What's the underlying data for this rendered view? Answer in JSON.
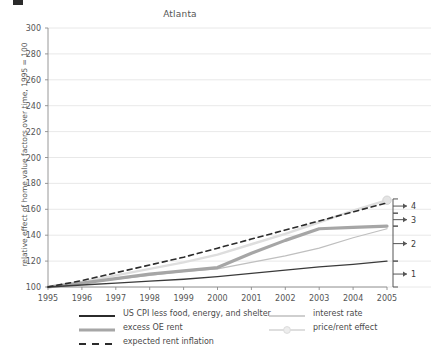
{
  "chart_data": {
    "type": "line",
    "title": "Atlanta",
    "xlabel": "",
    "ylabel": "relative effect of home value factors over time, 1995 = 100",
    "x": [
      1995,
      1996,
      1997,
      1998,
      1999,
      2000,
      2001,
      2002,
      2003,
      2004,
      2005
    ],
    "xlim": [
      1995,
      2005
    ],
    "ylim": [
      100,
      300
    ],
    "yticks": [
      100,
      120,
      140,
      160,
      180,
      200,
      220,
      240,
      260,
      280,
      300
    ],
    "xticks": [
      "1995",
      "1996",
      "1997",
      "1998",
      "1999",
      "2000",
      "2001",
      "2002",
      "2003",
      "2004",
      "2005"
    ],
    "grid": true,
    "legend_position": "below",
    "series": [
      {
        "name": "US CPI less food, energy, and shelter",
        "style": "solid",
        "color": "#3a3a3a",
        "width": 1.4,
        "values": [
          100,
          101.5,
          103,
          104.5,
          106,
          108,
          110.5,
          113,
          115.5,
          117.5,
          120
        ]
      },
      {
        "name": "excess OE rent",
        "style": "solid",
        "color": "#a6a6a6",
        "width": 3.2,
        "values": [
          100,
          103,
          106.5,
          110,
          112.5,
          115,
          126,
          136,
          145,
          146,
          147
        ]
      },
      {
        "name": "expected rent inflation",
        "style": "dashed",
        "color": "#2b2b2b",
        "width": 1.6,
        "values": [
          100,
          105,
          111,
          117,
          123,
          130,
          137,
          144,
          151,
          158,
          165
        ]
      },
      {
        "name": "interest rate",
        "style": "solid",
        "color": "#bfbfbf",
        "width": 1.2,
        "values": [
          100,
          103,
          106,
          109,
          112,
          114,
          119,
          124,
          130,
          138,
          145
        ]
      },
      {
        "name": "price/rent effect",
        "style": "solid-marker",
        "color": "#dedede",
        "width": 2.4,
        "values": [
          100,
          104,
          109,
          114,
          119,
          125,
          133,
          141,
          150,
          159,
          167
        ]
      }
    ],
    "annotations": [
      {
        "label": "1",
        "bracket_top": 120,
        "bracket_bottom": 100
      },
      {
        "label": "2",
        "bracket_top": 147,
        "bracket_bottom": 120
      },
      {
        "label": "3",
        "bracket_top": 157,
        "bracket_bottom": 147
      },
      {
        "label": "4",
        "bracket_top": 168,
        "bracket_bottom": 157
      }
    ]
  },
  "legend": {
    "left_column": [
      {
        "label": "US CPI less food, energy, and shelter",
        "style": "solid",
        "color": "#2b2b2b",
        "width": 1.8
      },
      {
        "label": "excess OE rent",
        "style": "solid",
        "color": "#a6a6a6",
        "width": 3.2
      },
      {
        "label": "expected rent inflation",
        "style": "dashed",
        "color": "#2b2b2b",
        "width": 1.8
      }
    ],
    "right_column": [
      {
        "label": "interest rate",
        "style": "solid",
        "color": "#bfbfbf",
        "width": 1.6
      },
      {
        "label": "price/rent effect",
        "style": "solid-marker",
        "color": "#dedede",
        "width": 2.2
      }
    ]
  },
  "colors": {
    "axis": "#8c8c8c",
    "grid": "#e2e2e2",
    "text": "#555555",
    "bracket": "#555555"
  }
}
